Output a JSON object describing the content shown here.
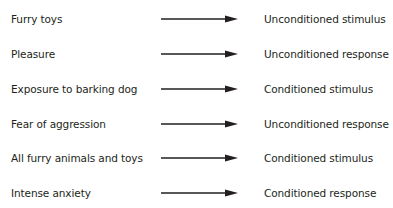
{
  "diagram": {
    "rows": [
      {
        "left": "Furry toys",
        "right": "Unconditioned stimulus"
      },
      {
        "left": "Pleasure",
        "right": "Unconditioned response"
      },
      {
        "left": "Exposure to barking dog",
        "right": "Conditioned stimulus"
      },
      {
        "left": "Fear of aggression",
        "right": "Unconditioned response"
      },
      {
        "left": "All furry animals and toys",
        "right": "Conditioned stimulus"
      },
      {
        "left": "Intense anxiety",
        "right": "Conditioned response"
      }
    ],
    "arrow_icon": "right-arrow",
    "colors": {
      "text": "#231f20",
      "arrow": "#231f20",
      "background": "#ffffff"
    }
  }
}
